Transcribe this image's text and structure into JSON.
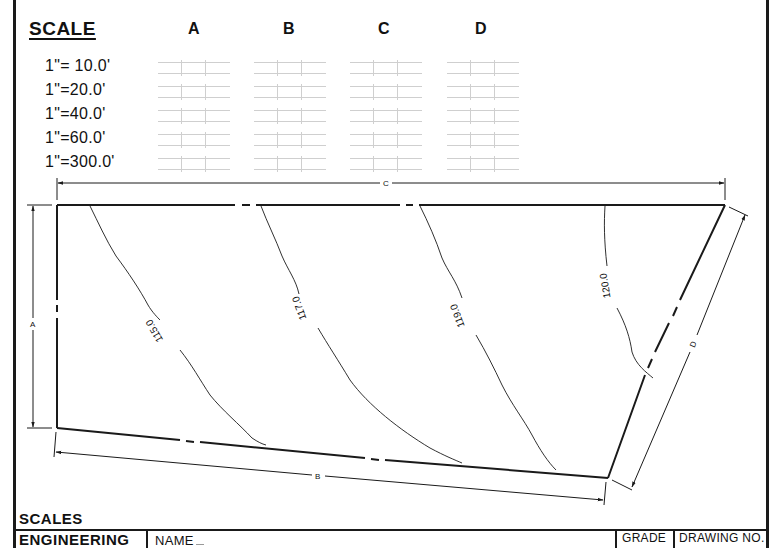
{
  "scale_table": {
    "title": "SCALE",
    "columns": [
      "A",
      "B",
      "C",
      "D"
    ],
    "rows": [
      {
        "scale": "1\"= 10.0'"
      },
      {
        "scale": "1\"=20.0'"
      },
      {
        "scale": "1\"=40.0'"
      },
      {
        "scale": "1\"=60.0'"
      },
      {
        "scale": "1\"=300.0'"
      }
    ]
  },
  "drawing": {
    "dimensions": {
      "a": "A",
      "b": "B",
      "c": "C",
      "d": "D"
    },
    "contours": [
      {
        "label": "115.0"
      },
      {
        "label": "117.0"
      },
      {
        "label": "119.0"
      },
      {
        "label": "120.0"
      }
    ]
  },
  "title_block": {
    "title": "SCALES",
    "course": "ENGINEERING",
    "name_label": "NAME",
    "grade_label": "GRADE",
    "drawing_no_label": "DRAWING NO."
  },
  "colors": {
    "ink": "#1a1a1a",
    "grid": "#cfcfcf",
    "paper": "#ffffff"
  }
}
